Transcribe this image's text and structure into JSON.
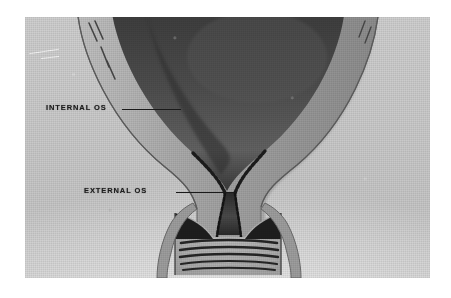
{
  "figure": {
    "kind": "anatomical-illustration",
    "medium": "halftone printed plate",
    "background_color": "#ffffff",
    "plate_color": "#c8c8c8"
  },
  "labels": [
    {
      "id": "internal-os",
      "text": "INTERNAL OS",
      "leader_from": [
        122,
        109
      ],
      "leader_to": [
        181,
        109
      ],
      "color": "#1a1a1a"
    },
    {
      "id": "external-os",
      "text": "EXTERNAL OS",
      "leader_from": [
        176,
        192
      ],
      "leader_to": [
        236,
        192
      ],
      "color": "#1a1a1a"
    }
  ],
  "structures": [
    {
      "name": "uterine-cavity",
      "tone": "#4a4a4a"
    },
    {
      "name": "myometrium-wall",
      "tone": "#9a9a9a"
    },
    {
      "name": "endometrial-lining",
      "tone": "#2a2a2a"
    },
    {
      "name": "cervical-canal",
      "tone": "#333333"
    },
    {
      "name": "cervical-rugae",
      "tone": "#5a5a5a"
    },
    {
      "name": "vaginal-fornix",
      "tone": "#b4b4b4"
    }
  ]
}
